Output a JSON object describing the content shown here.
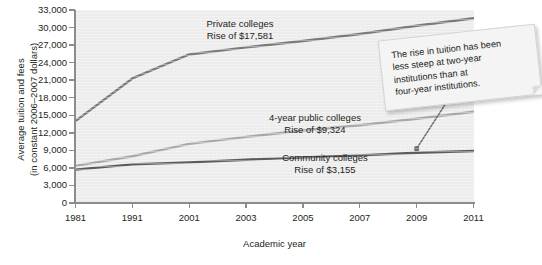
{
  "chart_data": {
    "type": "line",
    "title": "",
    "xlabel": "Academic year",
    "ylabel": "Average tuition and fees (in constant 2006–2007 dollars)",
    "ylabel_line1": "Average tuition and fees",
    "ylabel_line2": "(in constant 2006–2007 dollars)",
    "categories": [
      "1981",
      "1991",
      "2001",
      "2003",
      "2005",
      "2007",
      "2009",
      "2011"
    ],
    "ylim": [
      0,
      33000
    ],
    "ytick_step": 3000,
    "ytick_labels": [
      "0",
      "3,000",
      "6,000",
      "9,000",
      "12,000",
      "15,000",
      "18,000",
      "21,000",
      "24,000",
      "27,000",
      "30,000",
      "33,000"
    ],
    "grid": false,
    "legend_position": "inline-annotations",
    "series": [
      {
        "name": "Private colleges",
        "rise_label": "Rise of $17,581",
        "color": "#7b7b7b",
        "values": [
          14000,
          21300,
          25400,
          26600,
          27700,
          28900,
          30300,
          31600
        ]
      },
      {
        "name": "4-year public colleges",
        "rise_label": "Rise of $9,324",
        "color": "#a9a9a9",
        "values": [
          6350,
          8000,
          10100,
          11300,
          12400,
          13300,
          14400,
          15600
        ]
      },
      {
        "name": "Community colleges",
        "rise_label": "Rise of $3,155",
        "color": "#5c5c5c",
        "values": [
          5700,
          6600,
          6950,
          7400,
          7800,
          8150,
          8600,
          8900
        ]
      }
    ],
    "annotations": [
      {
        "name": "note",
        "lines": [
          "The rise in tuition has been",
          "less steep at two-year",
          "institutions than at",
          "four-year institutions."
        ],
        "arrow_target_category": "2009",
        "arrow_target_series": "Community colleges"
      }
    ]
  },
  "labels": {
    "private_name": "Private colleges",
    "private_rise": "Rise of $17,581",
    "public4_name": "4-year public colleges",
    "public4_rise": "Rise of $9,324",
    "community_name": "Community colleges",
    "community_rise": "Rise of $3,155"
  },
  "colors": {
    "plot_background": "#ededed",
    "axis": "#8c8c8c",
    "text": "#231f20",
    "private": "#7b7b7b",
    "public4": "#a9a9a9",
    "community": "#5c5c5c",
    "note_background": "#f4f4f4"
  }
}
